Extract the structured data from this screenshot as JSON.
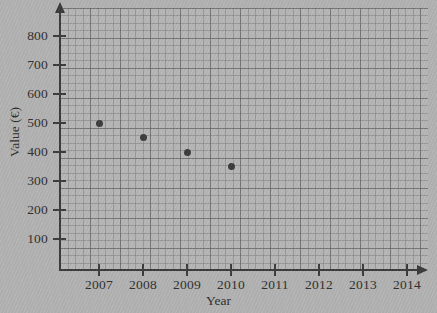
{
  "chart_data": {
    "type": "scatter",
    "title": "",
    "xlabel": "Year",
    "ylabel": "Value (€)",
    "x": [
      2007,
      2008,
      2009,
      2010
    ],
    "values": [
      500,
      450,
      400,
      350
    ],
    "points": [
      {
        "x": 2007,
        "y": 500
      },
      {
        "x": 2008,
        "y": 450
      },
      {
        "x": 2009,
        "y": 400
      },
      {
        "x": 2010,
        "y": 350
      }
    ],
    "xtick_labels": [
      "2007",
      "2008",
      "2009",
      "2010",
      "2011",
      "2012",
      "2013",
      "2014"
    ],
    "ytick_labels": [
      "100",
      "200",
      "300",
      "400",
      "500",
      "600",
      "700",
      "800"
    ],
    "ytick_values": [
      100,
      200,
      300,
      400,
      500,
      600,
      700,
      800
    ],
    "xlim": [
      2006.2,
      2014.9
    ],
    "ylim": [
      0,
      880
    ],
    "grid": true,
    "minor_grid": true,
    "legend": "none",
    "marker": "filled-circle",
    "marker_color": "#3b3b3b",
    "axis_color": "#3a3a3a",
    "grid_color": "#6e6e6e",
    "background_color": "#b2b2b2"
  },
  "axes": {
    "y_title": "Value (€)",
    "x_title": "Year",
    "y_ticks": [
      {
        "label": "800",
        "value": 800
      },
      {
        "label": "700",
        "value": 700
      },
      {
        "label": "600",
        "value": 600
      },
      {
        "label": "500",
        "value": 500
      },
      {
        "label": "400",
        "value": 400
      },
      {
        "label": "300",
        "value": 300
      },
      {
        "label": "200",
        "value": 200
      },
      {
        "label": "100",
        "value": 100
      }
    ],
    "x_ticks": [
      {
        "label": "2007",
        "value": 2007
      },
      {
        "label": "2008",
        "value": 2008
      },
      {
        "label": "2009",
        "value": 2009
      },
      {
        "label": "2010",
        "value": 2010
      },
      {
        "label": "2011",
        "value": 2011
      },
      {
        "label": "2012",
        "value": 2012
      },
      {
        "label": "2013",
        "value": 2013
      },
      {
        "label": "2014",
        "value": 2014
      }
    ]
  }
}
